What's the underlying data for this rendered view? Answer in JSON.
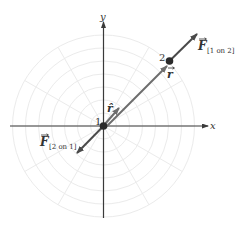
{
  "axes": {
    "x_label": "x",
    "y_label": "y"
  },
  "particles": [
    {
      "id": "1",
      "label": "1"
    },
    {
      "id": "2",
      "label": "2"
    }
  ],
  "vectors": {
    "r": {
      "symbol": "r"
    },
    "r_hat": {
      "symbol": "r̂"
    },
    "F_1_on_2": {
      "symbol": "F",
      "subscript": "[1 on 2]"
    },
    "F_2_on_1": {
      "symbol": "F",
      "subscript": "[2 on 1]"
    }
  },
  "colors": {
    "vector": "#4a4a4a",
    "r_vector": "#6d6d6d",
    "axis": "#3a3a3a",
    "grid": "#e8e8e8"
  }
}
